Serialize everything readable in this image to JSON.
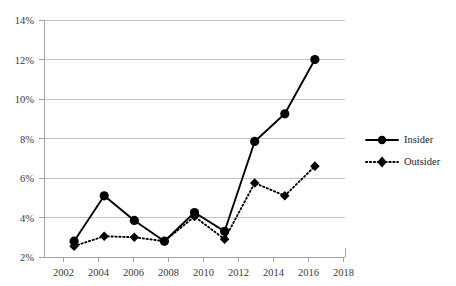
{
  "chart_data": {
    "type": "line",
    "title": "",
    "subtitle": "",
    "xlabel": "",
    "ylabel": "",
    "x": [
      2002,
      2004,
      2006,
      2008,
      2010,
      2012,
      2014,
      2016,
      2018
    ],
    "categories": [
      "2002",
      "2004",
      "2006",
      "2008",
      "2010",
      "2012",
      "2014",
      "2016",
      "2018"
    ],
    "xlim": [
      2001,
      2019
    ],
    "ylim": [
      2,
      14
    ],
    "y_ticks": [
      2,
      4,
      6,
      8,
      10,
      12,
      14
    ],
    "y_tick_labels": [
      "2%",
      "4%",
      "6%",
      "8%",
      "10%",
      "12%",
      "14%"
    ],
    "x_tick_labels": [
      "2002",
      "2004",
      "2006",
      "2008",
      "2010",
      "2012",
      "2014",
      "2016",
      "2018"
    ],
    "grid": true,
    "grid_axis": "y",
    "legend_position": "right",
    "series": [
      {
        "name": "Insider",
        "marker": "circle",
        "linestyle": "solid",
        "color": "#000000",
        "values": [
          2.8,
          5.1,
          3.85,
          2.8,
          4.25,
          3.3,
          7.85,
          9.25,
          12.0
        ]
      },
      {
        "name": "Outsider",
        "marker": "diamond",
        "linestyle": "dotted",
        "color": "#000000",
        "values": [
          2.55,
          3.05,
          3.0,
          2.8,
          4.05,
          2.9,
          5.75,
          5.1,
          6.6
        ]
      }
    ]
  },
  "legend": {
    "items": [
      {
        "label": "Insider",
        "marker": "circle",
        "linestyle": "solid"
      },
      {
        "label": "Outsider",
        "marker": "diamond",
        "linestyle": "dotted"
      }
    ]
  },
  "axes": {
    "y_labels": [
      "14%",
      "12%",
      "10%",
      "8%",
      "6%",
      "4%",
      "2%"
    ],
    "x_labels": [
      "2002",
      "2004",
      "2006",
      "2008",
      "2010",
      "2012",
      "2014",
      "2016",
      "2018"
    ]
  }
}
